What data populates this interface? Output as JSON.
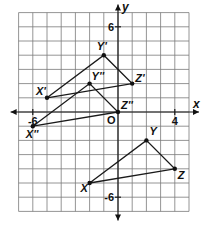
{
  "diagram": {
    "type": "coordinate-plane",
    "grid": {
      "xmin": -7,
      "xmax": 5,
      "ymin": -7,
      "ymax": 7,
      "step": 1
    },
    "axes": {
      "x_label": "x",
      "y_label": "y",
      "origin_label": "O"
    },
    "ticks": [
      {
        "axis": "x",
        "value": -6,
        "label": "-6"
      },
      {
        "axis": "x",
        "value": 4,
        "label": "4"
      },
      {
        "axis": "y",
        "value": 6,
        "label": "6"
      },
      {
        "axis": "y",
        "value": -6,
        "label": "-6"
      }
    ],
    "triangles": [
      {
        "name": "XYZ",
        "vertices": [
          {
            "label": "X",
            "x": -2,
            "y": -5
          },
          {
            "label": "Y",
            "x": 2,
            "y": -2
          },
          {
            "label": "Z",
            "x": 4,
            "y": -4
          }
        ]
      },
      {
        "name": "X'Y'Z'",
        "vertices": [
          {
            "label": "X'",
            "x": -5,
            "y": 1
          },
          {
            "label": "Y'",
            "x": -1,
            "y": 4
          },
          {
            "label": "Z'",
            "x": 1,
            "y": 2
          }
        ]
      },
      {
        "name": "X''Y''Z''",
        "vertices": [
          {
            "label": "X''",
            "x": -6,
            "y": -1
          },
          {
            "label": "Y''",
            "x": -2,
            "y": 2
          },
          {
            "label": "Z''",
            "x": 0,
            "y": 0
          }
        ]
      }
    ]
  }
}
